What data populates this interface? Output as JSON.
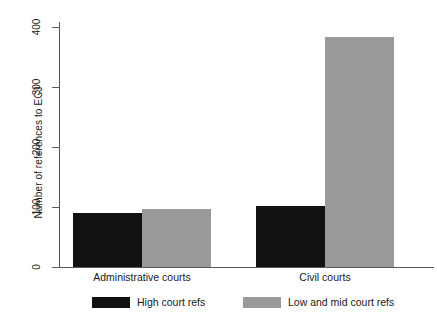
{
  "chart_data": {
    "type": "bar",
    "title": "",
    "xlabel": "",
    "ylabel": "Number of references to ECJ",
    "categories": [
      "Administrative courts",
      "Civil courts"
    ],
    "series": [
      {
        "name": "High court refs",
        "color": "#121212",
        "values": [
          90,
          102
        ]
      },
      {
        "name": "Low and mid court refs",
        "color": "#9a9a9a",
        "values": [
          96,
          383
        ]
      }
    ],
    "ylim": [
      0,
      400
    ],
    "yticks": [
      0,
      100,
      200,
      300,
      400
    ],
    "ytick_labels": [
      "0",
      "100",
      "200",
      "300",
      "400"
    ],
    "grid": false,
    "legend_position": "bottom"
  },
  "axis": {
    "y_title": "Number of references to ECJ",
    "ticks": [
      {
        "label": "400",
        "value": 400
      },
      {
        "label": "300",
        "value": 300
      },
      {
        "label": "200",
        "value": 200
      },
      {
        "label": "100",
        "value": 100
      },
      {
        "label": "0",
        "value": 0
      }
    ]
  },
  "categories": [
    {
      "label": "Administrative courts"
    },
    {
      "label": "Civil courts"
    }
  ],
  "legend": {
    "items": [
      {
        "label": "High court refs",
        "color": "#121212"
      },
      {
        "label": "Low and mid court refs",
        "color": "#9a9a9a"
      }
    ]
  }
}
